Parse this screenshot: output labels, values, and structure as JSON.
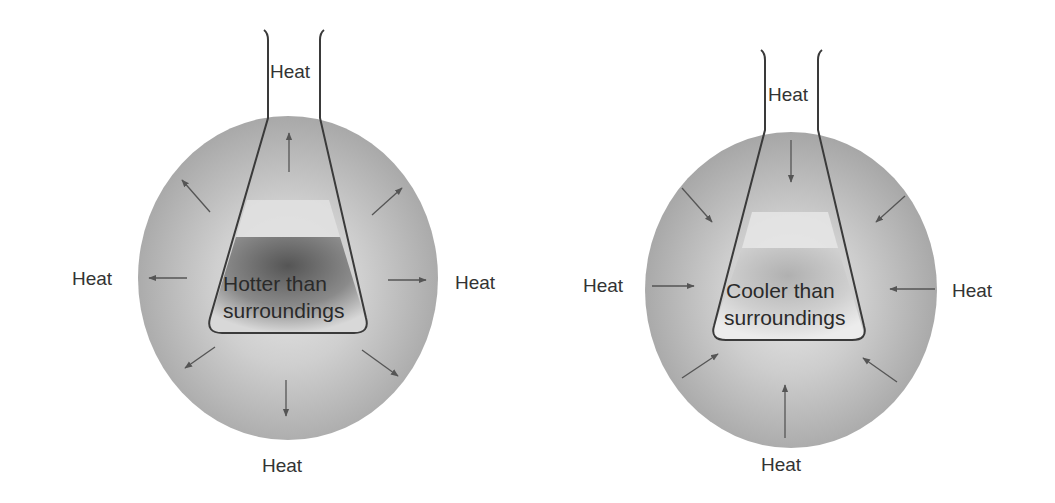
{
  "figure": {
    "panels": [
      {
        "id": "exothermic",
        "flask_label_line1": "Hotter than",
        "flask_label_line2": "surroundings",
        "heat_labels": {
          "top": "Heat",
          "left": "Heat",
          "right": "Heat",
          "bottom": "Heat"
        },
        "arrow_direction": "outward",
        "flask_contents_shade": "#6a6a6a"
      },
      {
        "id": "endothermic",
        "flask_label_line1": "Cooler than",
        "flask_label_line2": "surroundings",
        "heat_labels": {
          "top": "Heat",
          "left": "Heat",
          "right": "Heat",
          "bottom": "Heat"
        },
        "arrow_direction": "inward",
        "flask_contents_shade": "#b8b8b8"
      }
    ],
    "colors": {
      "surroundings": "#a9a9a9",
      "surroundings_center": "#e4e4e4",
      "outline": "#3a3a3a",
      "arrow": "#555555",
      "text": "#333333"
    }
  }
}
